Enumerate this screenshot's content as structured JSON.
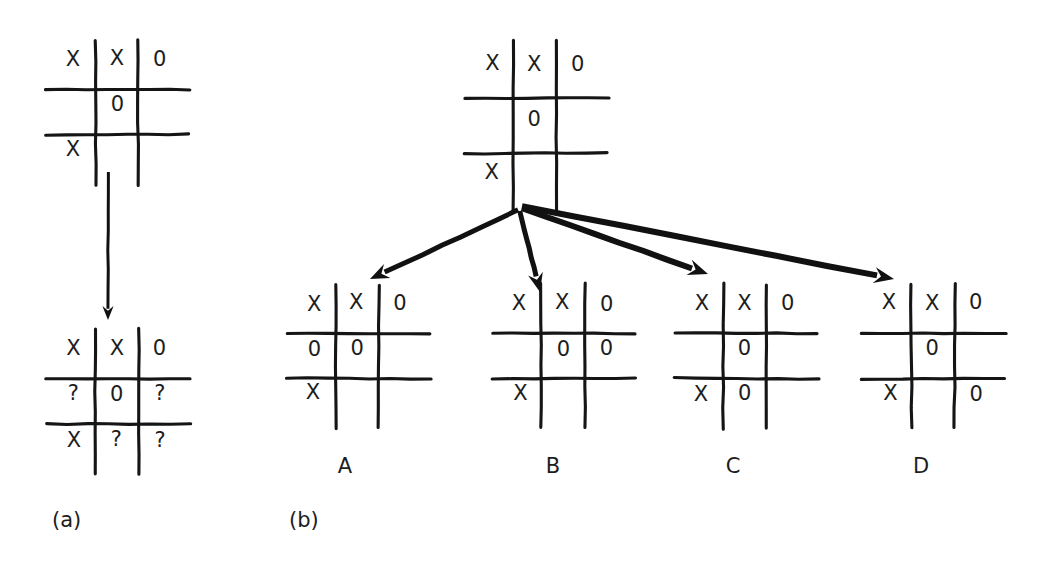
{
  "figure": {
    "background_color": "#ffffff",
    "ink_color": "#151515",
    "panels": [
      {
        "id": "a",
        "label": "(a)",
        "label_x": 52,
        "label_y": 521,
        "description": "single current board transformed into board with question marks"
      },
      {
        "id": "b",
        "label": "(b)",
        "label_x": 289,
        "label_y": 521,
        "description": "root board branching by arrows into four successor boards A B C D"
      }
    ],
    "boards": [
      {
        "name": "panel-a-current-board",
        "panel": "a",
        "x": 52,
        "y": 44,
        "w": 130,
        "h": 136,
        "cells": [
          [
            "X",
            "X",
            "0"
          ],
          [
            "",
            "0",
            ""
          ],
          [
            "X",
            "",
            ""
          ]
        ]
      },
      {
        "name": "panel-a-successor-board",
        "panel": "a",
        "x": 52,
        "y": 334,
        "w": 130,
        "h": 136,
        "cells": [
          [
            "X",
            "X",
            "0"
          ],
          [
            "?",
            "0",
            "?"
          ],
          [
            "X",
            "?",
            "?"
          ]
        ]
      },
      {
        "name": "panel-b-root-board",
        "panel": "b",
        "x": 470,
        "y": 44,
        "w": 130,
        "h": 164,
        "cells": [
          [
            "X",
            "X",
            "0"
          ],
          [
            "",
            "0",
            ""
          ],
          [
            "X",
            "",
            ""
          ]
        ]
      },
      {
        "name": "panel-b-option-board-a",
        "panel": "b",
        "option": "A",
        "x": 292,
        "y": 288,
        "w": 130,
        "h": 136,
        "cells": [
          [
            "X",
            "X",
            "0"
          ],
          [
            "0",
            "0",
            ""
          ],
          [
            "X",
            "",
            ""
          ]
        ]
      },
      {
        "name": "panel-b-option-board-b",
        "panel": "b",
        "option": "B",
        "x": 498,
        "y": 288,
        "w": 130,
        "h": 136,
        "cells": [
          [
            "X",
            "X",
            "0"
          ],
          [
            "",
            "0",
            "0"
          ],
          [
            "X",
            "",
            ""
          ]
        ]
      },
      {
        "name": "panel-b-option-board-c",
        "panel": "b",
        "option": "C",
        "x": 680,
        "y": 288,
        "w": 130,
        "h": 136,
        "cells": [
          [
            "X",
            "X",
            "0"
          ],
          [
            "",
            "0",
            ""
          ],
          [
            "X",
            "0",
            ""
          ]
        ]
      },
      {
        "name": "panel-b-option-board-d",
        "panel": "b",
        "option": "D",
        "x": 868,
        "y": 288,
        "w": 130,
        "h": 136,
        "cells": [
          [
            "X",
            "X",
            "0"
          ],
          [
            "",
            "0",
            ""
          ],
          [
            "X",
            "",
            "0"
          ]
        ]
      }
    ],
    "option_labels": [
      {
        "text": "A",
        "x": 345,
        "y": 467
      },
      {
        "text": "B",
        "x": 553,
        "y": 467
      },
      {
        "text": "C",
        "x": 733,
        "y": 467
      },
      {
        "text": "D",
        "x": 921,
        "y": 467
      }
    ],
    "arrows": [
      {
        "name": "panel-a-transition-arrow",
        "panel": "a",
        "x1": 108,
        "y1": 172,
        "x2": 108,
        "y2": 320,
        "width": 3,
        "head": 14
      },
      {
        "name": "panel-b-arrow-to-a",
        "panel": "b",
        "x1": 518,
        "y1": 210,
        "x2": 370,
        "y2": 279,
        "width": 5,
        "head": 19
      },
      {
        "name": "panel-b-arrow-to-b",
        "panel": "b",
        "x1": 520,
        "y1": 211,
        "x2": 540,
        "y2": 292,
        "width": 5,
        "head": 19
      },
      {
        "name": "panel-b-arrow-to-c",
        "panel": "b",
        "x1": 522,
        "y1": 208,
        "x2": 708,
        "y2": 274,
        "width": 6,
        "head": 20
      },
      {
        "name": "panel-b-arrow-to-d",
        "panel": "b",
        "x1": 522,
        "y1": 206,
        "x2": 894,
        "y2": 279,
        "width": 6,
        "head": 20
      }
    ]
  }
}
